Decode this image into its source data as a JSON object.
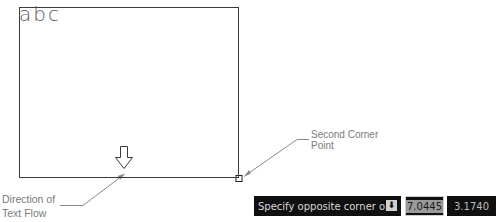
{
  "diagram": {
    "sample_text": "abc",
    "callouts": {
      "second_corner": [
        "Second Corner",
        "Point"
      ],
      "text_flow": [
        "Direction of",
        "Text Flow"
      ]
    }
  },
  "command_line": {
    "prompt": "Specify opposite corner or",
    "options_icon": "down-arrow-options-icon",
    "x_value": "7.0445",
    "y_value": "3.1740"
  },
  "colors": {
    "outline": "#3a3a3a",
    "callout_text": "#7a7a7a",
    "leader": "#8a8a8a",
    "prompt_bg": "#101010",
    "prompt_text": "#d8d8d8"
  }
}
